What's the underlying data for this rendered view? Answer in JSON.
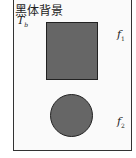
{
  "title": "黑体背景",
  "background_label": {
    "symbol": "T",
    "subscript": "b"
  },
  "shapes": [
    {
      "type": "square",
      "label": {
        "symbol": "f",
        "subscript": "1"
      },
      "fill": "#666666"
    },
    {
      "type": "circle",
      "label": {
        "symbol": "f",
        "subscript": "2"
      },
      "fill": "#666666"
    }
  ]
}
